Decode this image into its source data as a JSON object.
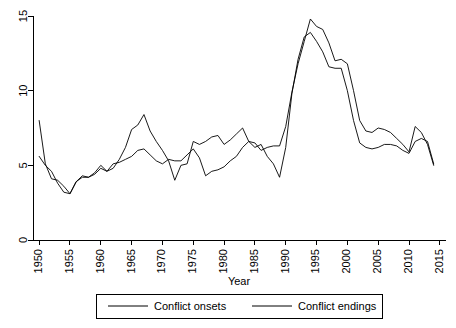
{
  "chart_data": {
    "type": "line",
    "title": "",
    "subtitle": "",
    "xlabel": "Year",
    "ylabel": "",
    "xlim": [
      1949,
      2016
    ],
    "ylim": [
      0,
      15
    ],
    "grid": false,
    "legend_position": "bottom",
    "xticks": [
      1950,
      1955,
      1960,
      1965,
      1970,
      1975,
      1980,
      1985,
      1990,
      1995,
      2000,
      2005,
      2010,
      2015
    ],
    "xtick_labels": [
      "1950",
      "1955",
      "1960",
      "1965",
      "1970",
      "1975",
      "1980",
      "1985",
      "1990",
      "1995",
      "2000",
      "2005",
      "2010",
      "2015"
    ],
    "yticks": [
      0,
      5,
      10,
      15
    ],
    "ytick_labels": [
      "0",
      "5",
      "10",
      "15"
    ],
    "x": [
      1950,
      1951,
      1952,
      1953,
      1954,
      1955,
      1956,
      1957,
      1958,
      1959,
      1960,
      1961,
      1962,
      1963,
      1964,
      1965,
      1966,
      1967,
      1968,
      1969,
      1970,
      1971,
      1972,
      1973,
      1974,
      1975,
      1976,
      1977,
      1978,
      1979,
      1980,
      1981,
      1982,
      1983,
      1984,
      1985,
      1986,
      1987,
      1988,
      1989,
      1990,
      1991,
      1992,
      1993,
      1994,
      1995,
      1996,
      1997,
      1998,
      1999,
      2000,
      2001,
      2002,
      2003,
      2004,
      2005,
      2006,
      2007,
      2008,
      2009,
      2010,
      2011,
      2012,
      2013,
      2014
    ],
    "series": [
      {
        "name": "Conflict onsets",
        "color": "#000000",
        "values": [
          8.0,
          5.1,
          4.1,
          4.0,
          3.6,
          3.1,
          3.9,
          4.2,
          4.2,
          4.4,
          4.8,
          4.6,
          4.8,
          5.4,
          6.2,
          7.4,
          7.7,
          8.4,
          7.3,
          6.6,
          6.0,
          5.3,
          4.0,
          5.0,
          5.1,
          6.6,
          6.4,
          6.6,
          6.9,
          7.0,
          6.4,
          6.7,
          7.1,
          7.5,
          6.6,
          6.2,
          6.4,
          5.6,
          5.1,
          4.2,
          6.2,
          9.8,
          12.1,
          13.6,
          13.9,
          13.3,
          12.6,
          11.6,
          11.5,
          11.5,
          10.0,
          8.0,
          6.5,
          6.2,
          6.1,
          6.2,
          6.4,
          6.4,
          6.3,
          6.0,
          5.8,
          6.6,
          6.8,
          6.6,
          5.1
        ]
      },
      {
        "name": "Conflict endings",
        "color": "#000000",
        "values": [
          5.6,
          5.0,
          4.6,
          3.8,
          3.2,
          3.1,
          3.9,
          4.3,
          4.2,
          4.5,
          5.0,
          4.6,
          5.1,
          5.2,
          5.4,
          5.6,
          6.0,
          6.1,
          5.7,
          5.3,
          5.1,
          5.4,
          5.3,
          5.3,
          5.7,
          6.1,
          5.5,
          4.3,
          4.6,
          4.7,
          4.9,
          5.3,
          5.6,
          6.2,
          6.6,
          6.5,
          6.0,
          6.2,
          6.3,
          6.3,
          7.6,
          9.9,
          11.8,
          13.3,
          14.8,
          14.3,
          14.1,
          13.2,
          12.0,
          12.1,
          11.8,
          10.0,
          8.0,
          7.3,
          7.2,
          7.5,
          7.4,
          7.2,
          6.8,
          6.4,
          5.9,
          7.6,
          7.2,
          6.4,
          5.0
        ]
      }
    ]
  },
  "legend": {
    "entries": [
      {
        "label": "Conflict onsets"
      },
      {
        "label": "Conflict endings"
      }
    ]
  }
}
